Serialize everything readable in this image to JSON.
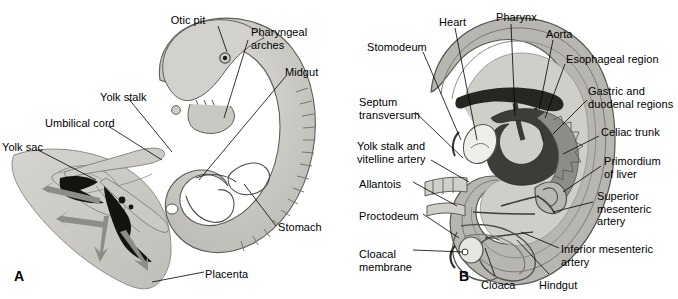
{
  "figure": {
    "background_color": "#ffffff",
    "label_color": "#000000",
    "leader_line_color": "#000000",
    "panels": [
      {
        "letter": "A",
        "name": "panel-a-embryo-with-yolk-sac-and-placenta",
        "labels": [
          {
            "id": "otic-pit",
            "text": "Otic pit",
            "x": 188,
            "y": 14,
            "align": "center"
          },
          {
            "id": "pharyngeal-arches",
            "text": "Pharyngeal\narches",
            "x": 251,
            "y": 26,
            "align": "left"
          },
          {
            "id": "midgut",
            "text": "Midgut",
            "x": 285,
            "y": 66,
            "align": "left"
          },
          {
            "id": "yolk-stalk",
            "text": "Yolk stalk",
            "x": 100,
            "y": 91,
            "align": "left"
          },
          {
            "id": "umbilical-cord",
            "text": "Umbilical cord",
            "x": 45,
            "y": 117,
            "align": "left"
          },
          {
            "id": "yolk-sac",
            "text": "Yolk sac",
            "x": 2,
            "y": 141,
            "align": "left"
          },
          {
            "id": "stomach",
            "text": "Stomach",
            "x": 278,
            "y": 221,
            "align": "left"
          },
          {
            "id": "placenta",
            "text": "Placenta",
            "x": 205,
            "y": 268,
            "align": "left"
          }
        ]
      },
      {
        "letter": "B",
        "name": "panel-b-embryo-sagittal-gut-tube",
        "labels": [
          {
            "id": "heart",
            "text": "Heart",
            "x": 100,
            "y": 16,
            "align": "left"
          },
          {
            "id": "pharynx",
            "text": "Pharynx",
            "x": 157,
            "y": 11,
            "align": "left"
          },
          {
            "id": "aorta",
            "text": "Aorta",
            "x": 207,
            "y": 28,
            "align": "left"
          },
          {
            "id": "stomodeum",
            "text": "Stomodeum",
            "x": 28,
            "y": 41,
            "align": "left"
          },
          {
            "id": "esophageal-region",
            "text": "Esophageal region",
            "x": 227,
            "y": 53,
            "align": "left"
          },
          {
            "id": "gastric-duodenal",
            "text": "Gastric and\nduodenal regions",
            "x": 249,
            "y": 85,
            "align": "left"
          },
          {
            "id": "septum-transversum",
            "text": "Septum\ntransversum",
            "x": 20,
            "y": 96,
            "align": "left"
          },
          {
            "id": "celiac-trunk",
            "text": "Celiac trunk",
            "x": 262,
            "y": 126,
            "align": "left"
          },
          {
            "id": "yolk-stalk-vitelline",
            "text": "Yolk stalk and\nvitelline artery",
            "x": 18,
            "y": 140,
            "align": "left"
          },
          {
            "id": "primordium-of-liver",
            "text": "Primordium\nof liver",
            "x": 265,
            "y": 155,
            "align": "left"
          },
          {
            "id": "allantois",
            "text": "Allantois",
            "x": 20,
            "y": 178,
            "align": "left"
          },
          {
            "id": "superior-mesenteric",
            "text": "Superior\nmesenteric\nartery",
            "x": 258,
            "y": 190,
            "align": "left"
          },
          {
            "id": "proctodeum",
            "text": "Proctodeum",
            "x": 20,
            "y": 210,
            "align": "left"
          },
          {
            "id": "cloacal-membrane",
            "text": "Cloacal\nmembrane",
            "x": 20,
            "y": 248,
            "align": "left"
          },
          {
            "id": "inferior-mesenteric",
            "text": "Inferior mesenteric\nartery",
            "x": 222,
            "y": 243,
            "align": "left"
          },
          {
            "id": "cloaca",
            "text": "Cloaca",
            "x": 142,
            "y": 279,
            "align": "left"
          },
          {
            "id": "hindgut",
            "text": "Hindgut",
            "x": 200,
            "y": 279,
            "align": "left"
          }
        ]
      }
    ],
    "palette": {
      "placenta_fill": "#cbc9c4",
      "placenta_edge": "#9a978f",
      "embryo_body_fill": "#c3c2bd",
      "embryo_body_light": "#d4d3cf",
      "embryo_outline": "#5d5b57",
      "yolk_sac_fill": "#c9c7c1",
      "vessel_dark": "#111111",
      "vessel_mid": "#7d7b76",
      "arrow_gray": "#8e8c87",
      "ring_outer": "#b6b4ae",
      "ring_mid": "#9c9a94",
      "ring_inner": "#cfcec9",
      "gut_dark": "#3a3935",
      "gut_mid": "#8a8883",
      "gut_light": "#f2f1ee"
    }
  }
}
